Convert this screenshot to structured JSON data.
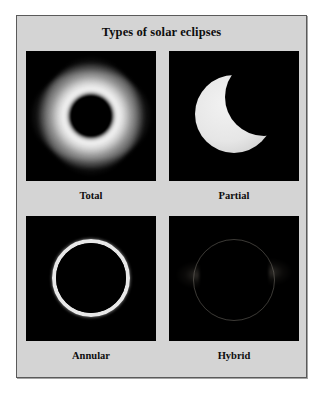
{
  "figure": {
    "title": "Types of solar eclipses",
    "plate_background_color": "#d4d4d4",
    "plate_border_color": "#5a5a5a",
    "photo_background_color": "#000000"
  },
  "eclipses": [
    {
      "label": "Total",
      "icon": "total-eclipse-icon",
      "description": "Black moon disk surrounded by bright white corona"
    },
    {
      "label": "Partial",
      "icon": "partial-eclipse-icon",
      "description": "Bright crescent sun with dark moon covering upper right"
    },
    {
      "label": "Annular",
      "icon": "annular-eclipse-icon",
      "description": "Thin bright ring of fire around black moon disk"
    },
    {
      "label": "Hybrid",
      "icon": "hybrid-eclipse-icon",
      "description": "Very faint circle outline with dim corona streamers at left and right"
    }
  ]
}
